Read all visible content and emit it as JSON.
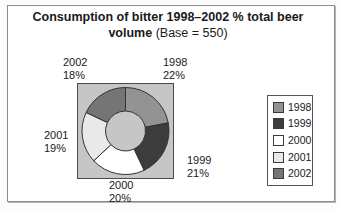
{
  "title": {
    "line1": "Consumption of bitter 1998–2002 % total beer",
    "line2_bold": "volume",
    "line2_regular": "(Base = 550)"
  },
  "chart_data": {
    "type": "pie",
    "subtype": "donut",
    "title": "Consumption of bitter 1998–2002 % total beer volume (Base = 550)",
    "base": 550,
    "categories": [
      "1998",
      "1999",
      "2000",
      "2001",
      "2002"
    ],
    "values": [
      22,
      21,
      20,
      19,
      18
    ],
    "unit": "%",
    "start_angle_deg": 0,
    "clockwise": true,
    "inner_radius_ratio": 0.46,
    "colors": [
      "#939393",
      "#3c3c3c",
      "#ffffff",
      "#e9e9e9",
      "#757575"
    ],
    "plot_bg": "#c6c6c6",
    "outline": "#333333",
    "legend_position": "right",
    "grid": false,
    "callouts": [
      {
        "year": "1998",
        "value": "22%"
      },
      {
        "year": "1999",
        "value": "21%"
      },
      {
        "year": "2000",
        "value": "20%"
      },
      {
        "year": "2001",
        "value": "19%"
      },
      {
        "year": "2002",
        "value": "18%"
      }
    ]
  },
  "legend": {
    "items": [
      "1998",
      "1999",
      "2000",
      "2001",
      "2002"
    ]
  }
}
